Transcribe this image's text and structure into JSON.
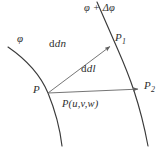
{
  "figure": {
    "labels": {
      "phi_left": "φ",
      "phi_plus_delta": "φ + Δφ",
      "vector_dn": "dn",
      "vector_dl": "dl",
      "point_p": "P",
      "point_p1_base": "P",
      "point_p1_sub": "1",
      "point_p2_base": "P",
      "point_p2_sub": "2",
      "point_coords": "P(u,v,w)",
      "caption": ""
    },
    "colors": {
      "curve": "#3a3a3a",
      "vector": "#6e6e6e",
      "text": "#2e2e2e",
      "background": "#ffffff"
    },
    "geometry": {
      "curve_phi": "M 8 47 C 24 58, 40 74, 48 93 C 55 110, 60 129, 62 146",
      "curve_phi_delta": "M 97 2 C 104 18, 110 32, 118 50 C 129 75, 140 103, 148 146",
      "vector_dn_from": [
        48,
        93
      ],
      "vector_dn_to": [
        112,
        45
      ],
      "vector_dl_from": [
        48,
        93
      ],
      "vector_dl_to": [
        141,
        89
      ],
      "point_p": [
        48,
        93
      ],
      "point_p1": [
        112,
        45
      ],
      "point_p2": [
        141,
        89
      ]
    }
  }
}
